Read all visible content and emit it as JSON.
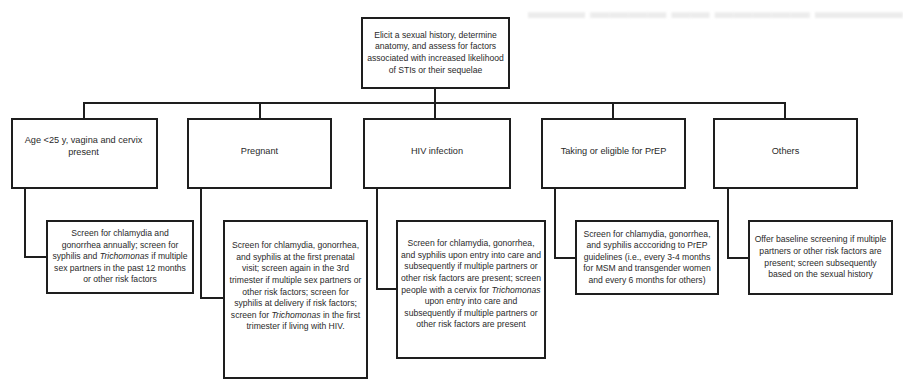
{
  "diagram": {
    "root": {
      "text": "Elicit a sexual history, determine anatomy, and assess for factors associated with increased likelihood of STIs or their sequelae"
    },
    "categories": [
      {
        "label": "Age <25 y, vagina and cervix present",
        "recommendation_parts": [
          "Screen for chlamydia and gonorrhea annually; screen for syphilis and ",
          "Trichomonas",
          " if multiple sex partners in the past 12 months or other risk factors"
        ]
      },
      {
        "label": "Pregnant",
        "recommendation_parts": [
          "Screen for chlamydia, gonorrhea, and syphilis at the first prenatal visit; screen again in the 3rd trimester if multiple sex partners or other risk factors; screen for syphilis at delivery if risk factors; screen for ",
          "Trichomonas",
          " in the first trimester if living with HIV."
        ]
      },
      {
        "label": "HIV infection",
        "recommendation_parts": [
          "Screen for chlamydia, gonorrhea, and syphilis upon entry into care and subsequently if multiple partners or other risk factors are present; screen people with a cervix for ",
          "Trichomonas",
          " upon entry into care and subsequently if multiple partners or other risk factors are present"
        ]
      },
      {
        "label": "Taking or eligible for PrEP",
        "recommendation_parts": [
          "Screen for chlamydia, gonorrhea, and syphilis acccoridng to PrEP guidelines (i.e., every 3-4 months for MSM and transgender women and every 6 months for others)",
          "",
          ""
        ]
      },
      {
        "label": "Others",
        "recommendation_parts": [
          "Offer baseline screening if multiple partners or other risk factors are present; screen subsequently based on the sexual history",
          "",
          ""
        ]
      }
    ]
  }
}
